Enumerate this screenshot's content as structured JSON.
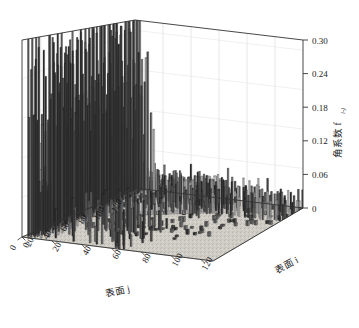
{
  "chart_data": {
    "type": "bar",
    "render": "3d-bar",
    "title": "",
    "xlabel": "表面 j",
    "ylabel": "表面 i",
    "zlabel": "角系数 f",
    "zlabel_sub": "i-j",
    "xticks": [
      0,
      20,
      40,
      60,
      80,
      100,
      120
    ],
    "yticks": [
      0,
      20,
      40,
      60,
      80,
      100,
      120
    ],
    "zticks": [
      0,
      0.06,
      0.12,
      0.18,
      0.24,
      0.3
    ],
    "ztick_labels": [
      "0",
      "0.06",
      "0.12",
      "0.18",
      "0.24",
      "0.30"
    ],
    "xlim": [
      0,
      128
    ],
    "ylim": [
      0,
      128
    ],
    "zlim": [
      0,
      0.3
    ],
    "grid": true,
    "legend": null,
    "colors": {
      "bar_dark": "#2b2b2b",
      "bar_mid": "#5a5a5a",
      "bar_light": "#bdbdbd",
      "bar_pale": "#d9d9d9",
      "floor": "#cdcac3",
      "wall": "#fdfdfd",
      "axis_line": "#3a3a3a",
      "grid_line": "#d0d0d0"
    },
    "series": [
      {
        "name": "back-left tall cluster (j 0-55)",
        "j_range": [
          0,
          55
        ],
        "values": [
          0.3,
          0.17,
          0.3,
          0.17,
          0.3,
          0.16,
          0.07,
          0.07,
          0.07,
          0.28,
          0.18,
          0.29,
          0.22,
          0.29,
          0.24,
          0.29,
          0.2,
          0.28,
          0.16,
          0.29,
          0.23,
          0.3,
          0.18,
          0.26,
          0.15,
          0.3,
          0.21,
          0.28,
          0.24,
          0.29,
          0.19,
          0.27,
          0.14,
          0.29,
          0.22,
          0.3,
          0.17,
          0.26,
          0.13,
          0.3,
          0.2,
          0.28,
          0.25,
          0.29,
          0.16,
          0.27,
          0.21,
          0.3,
          0.18,
          0.24,
          0.12,
          0.29,
          0.23,
          0.3,
          0.19,
          0.17
        ]
      },
      {
        "name": "mid diagonal ridge (light gray)",
        "j_range": [
          56,
          100
        ],
        "values": [
          0.055,
          0.05,
          0.055,
          0.05,
          0.055,
          0.05,
          0.055,
          0.05,
          0.055,
          0.05,
          0.055,
          0.05,
          0.055,
          0.05,
          0.055,
          0.05,
          0.055,
          0.05,
          0.055,
          0.05,
          0.055,
          0.05,
          0.055,
          0.05,
          0.055,
          0.05,
          0.055,
          0.05,
          0.055,
          0.05,
          0.055,
          0.05,
          0.055,
          0.05,
          0.055,
          0.05,
          0.055,
          0.05,
          0.055,
          0.05,
          0.055,
          0.05,
          0.055,
          0.05,
          0.05
        ]
      },
      {
        "name": "right foreground short bars (i 0-60)",
        "i_range": [
          0,
          60
        ],
        "values": [
          0.045,
          0.04,
          0.05,
          0.035,
          0.045,
          0.03,
          0.04,
          0.05,
          0.035,
          0.045,
          0.03,
          0.04,
          0.045,
          0.03,
          0.035,
          0.04,
          0.045,
          0.03,
          0.04,
          0.035,
          0.045,
          0.03,
          0.04,
          0.05,
          0.03,
          0.035,
          0.04,
          0.045,
          0.03,
          0.035,
          0.04,
          0.03,
          0.045,
          0.035,
          0.04,
          0.03,
          0.035,
          0.045,
          0.03,
          0.04,
          0.035,
          0.03,
          0.04,
          0.035,
          0.03,
          0.04,
          0.035,
          0.03,
          0.025,
          0.035,
          0.03,
          0.025,
          0.03,
          0.035,
          0.025,
          0.03,
          0.02,
          0.03,
          0.025,
          0.02,
          0.025
        ]
      },
      {
        "name": "floor near-zero marks",
        "values": [
          0.004,
          0.006,
          0.003,
          0.005,
          0.004,
          0.006,
          0.003,
          0.005,
          0.004,
          0.006
        ]
      }
    ]
  },
  "axes": {
    "x_title": "表面 j",
    "y_title": "表面 i",
    "z_title_main": "角系数 f",
    "z_title_sub": "i-j"
  }
}
